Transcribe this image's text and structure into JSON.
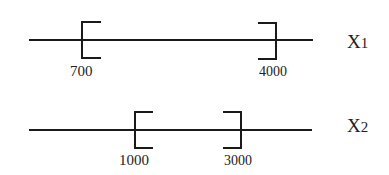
{
  "diagram": {
    "rows": [
      {
        "name": "X1",
        "var": "X",
        "sub": "1",
        "lower": "700",
        "upper": "4000"
      },
      {
        "name": "X2",
        "var": "X",
        "sub": "2",
        "lower": "1000",
        "upper": "3000"
      }
    ],
    "colors": {
      "stroke": "#1a1a1a",
      "text": "#222222"
    }
  }
}
